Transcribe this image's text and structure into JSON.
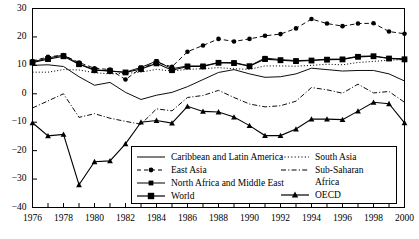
{
  "chart_data": {
    "type": "line",
    "title": "",
    "xlabel": "",
    "ylabel": "",
    "xlim": [
      1976,
      2000
    ],
    "ylim": [
      -40,
      30
    ],
    "grid": false,
    "legend_position": "inside-bottom-center",
    "y_ticks": [
      30,
      20,
      10,
      0,
      -10,
      -20,
      -30,
      -40
    ],
    "y_tick_labels": [
      "30",
      "20",
      "10",
      "0",
      "−10",
      "−20",
      "−30",
      "−40"
    ],
    "x_ticks": [
      1976,
      1977,
      1978,
      1979,
      1980,
      1981,
      1982,
      1983,
      1984,
      1985,
      1986,
      1987,
      1988,
      1989,
      1990,
      1991,
      1992,
      1993,
      1994,
      1995,
      1996,
      1997,
      1998,
      1999,
      2000
    ],
    "x_tick_labels_shown": [
      "1976",
      "1978",
      "1980",
      "1982",
      "1984",
      "1986",
      "1988",
      "1990",
      "1992",
      "1994",
      "1996",
      "1998",
      "2000"
    ],
    "x": [
      1976,
      1977,
      1978,
      1979,
      1980,
      1981,
      1982,
      1983,
      1984,
      1985,
      1986,
      1987,
      1988,
      1989,
      1990,
      1991,
      1992,
      1993,
      1994,
      1995,
      1996,
      1997,
      1998,
      1999,
      2000
    ],
    "series": [
      {
        "name": "Caribbean and Latin America",
        "style": "solid",
        "marker": "none",
        "values": [
          10.0,
          10.2,
          9.6,
          6.0,
          3.0,
          4.0,
          0.5,
          -2.0,
          -0.5,
          0.5,
          2.5,
          5.0,
          7.5,
          8.5,
          7.0,
          5.8,
          6.0,
          7.0,
          9.0,
          8.5,
          8.0,
          8.2,
          8.2,
          7.0,
          4.5
        ]
      },
      {
        "name": "East Asia",
        "style": "dashed",
        "marker": "circle",
        "values": [
          11.5,
          13.0,
          13.6,
          11.0,
          9.0,
          8.5,
          5.0,
          9.0,
          11.0,
          9.5,
          14.8,
          17.0,
          19.3,
          18.4,
          19.3,
          20.4,
          21.0,
          23.0,
          26.3,
          24.7,
          23.8,
          24.7,
          24.8,
          21.9,
          21.1
        ]
      },
      {
        "name": "North Africa and Middle East",
        "style": "solid",
        "marker": "square-small",
        "values": [
          11.2,
          12.6,
          13.6,
          10.5,
          8.5,
          8.0,
          7.6,
          9.3,
          11.5,
          8.8,
          9.8,
          9.8,
          11.0,
          11.0,
          9.8,
          12.6,
          12.0,
          11.7,
          11.8,
          12.2,
          12.2,
          13.2,
          13.3,
          12.5,
          12.3
        ]
      },
      {
        "name": "World",
        "style": "solid",
        "marker": "square",
        "values": [
          11.0,
          12.2,
          13.2,
          10.4,
          8.3,
          8.0,
          7.5,
          8.7,
          10.7,
          8.3,
          9.6,
          9.6,
          10.9,
          10.8,
          9.7,
          12.2,
          11.8,
          11.5,
          11.7,
          12.0,
          12.1,
          13.0,
          13.2,
          12.4,
          12.1
        ]
      },
      {
        "name": "South Asia",
        "style": "dotted",
        "marker": "none",
        "values": [
          7.6,
          7.6,
          8.5,
          8.4,
          7.4,
          7.0,
          7.2,
          7.6,
          8.6,
          8.0,
          8.6,
          8.8,
          9.2,
          8.8,
          8.6,
          9.8,
          9.8,
          9.7,
          10.0,
          10.4,
          10.2,
          11.0,
          11.4,
          11.8,
          12.0
        ]
      },
      {
        "name": "Sub-Saharan Africa",
        "style": "dashdot",
        "marker": "none",
        "values": [
          -5.0,
          -2.5,
          0.0,
          -8.3,
          -7.0,
          -8.6,
          -9.7,
          -10.7,
          -5.3,
          -6.0,
          -1.3,
          -0.6,
          1.2,
          -1.3,
          -3.6,
          -4.6,
          -4.2,
          -2.6,
          2.2,
          1.4,
          0.2,
          3.4,
          0.3,
          0.8,
          -3.0
        ]
      },
      {
        "name": "OECD",
        "style": "solid",
        "marker": "triangle",
        "values": [
          -10.2,
          -14.8,
          -14.3,
          -32.0,
          -23.9,
          -23.6,
          -17.6,
          -10.0,
          -9.4,
          -10.3,
          -4.4,
          -6.2,
          -6.4,
          -8.2,
          -11.2,
          -14.7,
          -14.7,
          -12.4,
          -8.9,
          -8.9,
          -9.1,
          -6.1,
          -3.0,
          -3.5,
          -10.2
        ]
      }
    ]
  },
  "legend": {
    "left_items": [
      {
        "label": "Caribbean and Latin America",
        "icon": "solid-line-icon"
      },
      {
        "label": "East Asia",
        "icon": "dashed-circle-line-icon"
      },
      {
        "label": "North Africa and Middle East",
        "icon": "solid-square-small-line-icon"
      },
      {
        "label": "World",
        "icon": "solid-square-line-icon"
      }
    ],
    "right_items": [
      {
        "label": "South Asia",
        "icon": "dotted-line-icon"
      },
      {
        "label": "Sub-Saharan",
        "label2": "Africa",
        "icon": "dashdot-line-icon"
      },
      {
        "label": "OECD",
        "icon": "solid-triangle-line-icon"
      }
    ]
  },
  "colors": {
    "line": "#000000",
    "axis": "#000000",
    "background": "#ffffff"
  }
}
